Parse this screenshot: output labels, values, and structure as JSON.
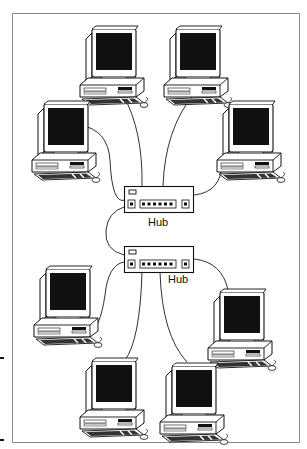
{
  "diagram": {
    "type": "network-topology",
    "hubs": [
      {
        "id": "hub1",
        "label": "Hub",
        "connected_computers": 4
      },
      {
        "id": "hub2",
        "label": "Hub",
        "connected_computers": 4
      }
    ],
    "computers": [
      {
        "id": "pc-top-left",
        "hub": "hub1"
      },
      {
        "id": "pc-top-right",
        "hub": "hub1"
      },
      {
        "id": "pc-mid-left",
        "hub": "hub1"
      },
      {
        "id": "pc-mid-right",
        "hub": "hub1"
      },
      {
        "id": "pc-lower-left",
        "hub": "hub2"
      },
      {
        "id": "pc-lower-right",
        "hub": "hub2"
      },
      {
        "id": "pc-bottom-left",
        "hub": "hub2"
      },
      {
        "id": "pc-bottom-right",
        "hub": "hub2"
      }
    ],
    "links": [
      {
        "from": "hub1",
        "to": "hub2",
        "kind": "uplink"
      }
    ],
    "colors": {
      "line": "#1a1a1a",
      "screen": "#111111",
      "frame": "#888888",
      "background": "#ffffff"
    }
  }
}
